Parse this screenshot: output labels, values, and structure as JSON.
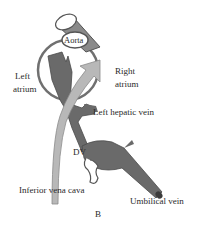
{
  "figure": {
    "panel_label": "B",
    "colors": {
      "dark_vessel": "#6a6a6a",
      "light_vessel": "#b8b8b8",
      "outline": "#555555",
      "background": "#ffffff"
    }
  },
  "labels": {
    "aorta": "Aorta",
    "left_atrium_line1": "Left",
    "left_atrium_line2": "atrium",
    "right_atrium_line1": "Right",
    "right_atrium_line2": "atrium",
    "left_hepatic_vein": "Left hepatic vein",
    "dv": "DV",
    "inferior_vena_cava": "Inferior vena cava",
    "umbilical_vein": "Umbilical vein"
  }
}
